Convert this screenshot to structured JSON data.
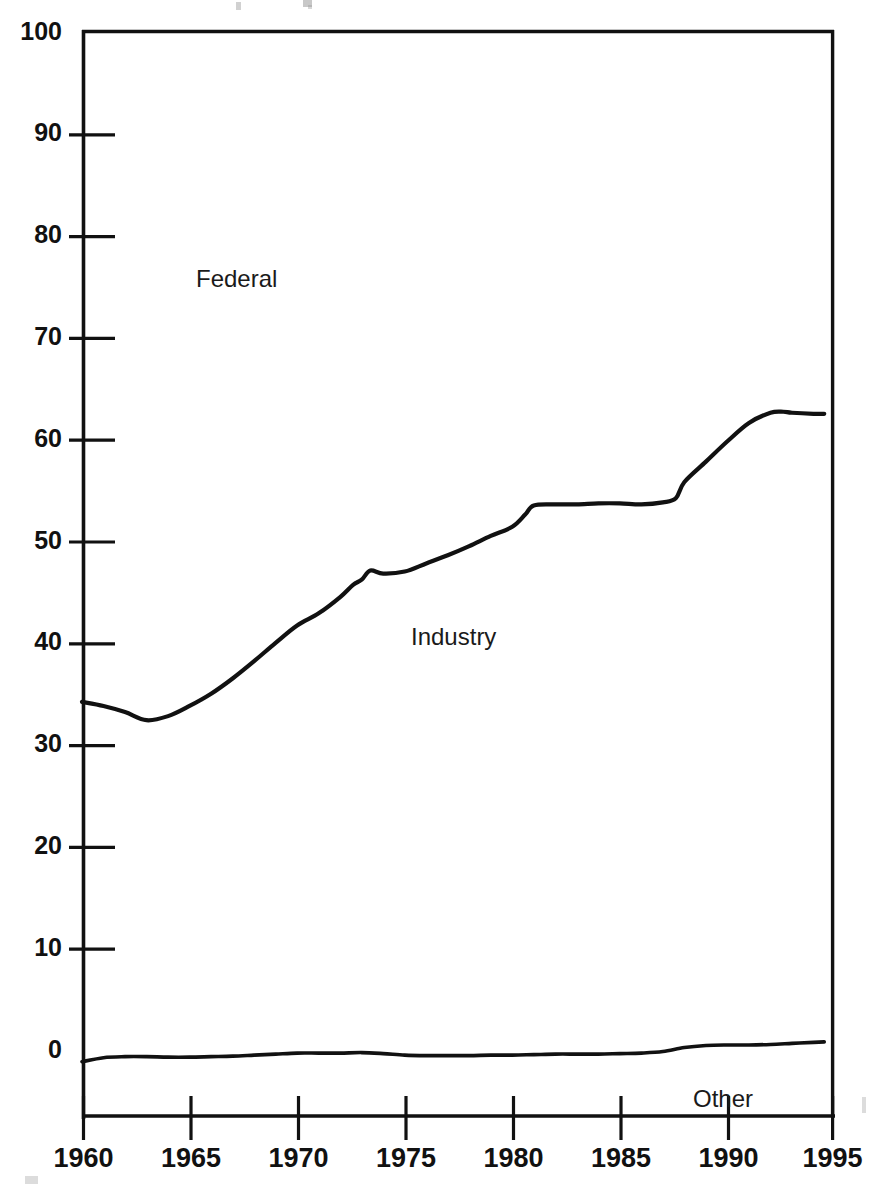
{
  "chart_data": {
    "type": "line",
    "title": "",
    "subtitle": "",
    "xlabel": "",
    "ylabel": "",
    "xlim": [
      1960,
      1995
    ],
    "ylim": [
      0,
      100
    ],
    "xticks": [
      1960,
      1965,
      1970,
      1975,
      1980,
      1985,
      1990,
      1995
    ],
    "xtick_labels": [
      "1960",
      "1965",
      "1970",
      "1975",
      "1980",
      "1985",
      "1990",
      "1995"
    ],
    "yticks": [
      0,
      10,
      20,
      30,
      40,
      50,
      60,
      70,
      80,
      90,
      100
    ],
    "ytick_labels": [
      "0",
      "10",
      "20",
      "30",
      "40",
      "50",
      "60",
      "70",
      "80",
      "90",
      "100"
    ],
    "grid": false,
    "legend_position": "inline-annotations",
    "line_color": "#111111",
    "background_color": "#ffffff",
    "annotations": [
      {
        "text": "Federal",
        "x": 1964.2,
        "y": 78.0
      },
      {
        "text": "Industry",
        "x": 1975.4,
        "y": 43.0
      },
      {
        "text": "Other",
        "x": 1988.6,
        "y": -5.2
      }
    ],
    "series": [
      {
        "name": "Industry",
        "label": "Industry",
        "x": [
          1960,
          1961,
          1962,
          1963,
          1964,
          1965,
          1966,
          1967,
          1968,
          1969,
          1970,
          1971,
          1972,
          1972.6,
          1973,
          1973.4,
          1974,
          1975,
          1976,
          1977,
          1978,
          1979,
          1980,
          1980.6,
          1981,
          1982,
          1983,
          1984,
          1985,
          1986,
          1987,
          1987.6,
          1988,
          1989,
          1990,
          1991,
          1992,
          1992.6,
          1993,
          1994,
          1994.5
        ],
        "values": [
          34.0,
          33.6,
          33.0,
          32.2,
          32.6,
          33.6,
          34.8,
          36.3,
          38.0,
          39.8,
          41.5,
          42.7,
          44.3,
          45.5,
          46.0,
          46.9,
          46.6,
          46.8,
          47.6,
          48.4,
          49.3,
          50.3,
          51.2,
          52.4,
          53.3,
          53.4,
          53.4,
          53.5,
          53.5,
          53.4,
          53.6,
          54.0,
          55.6,
          57.6,
          59.6,
          61.4,
          62.4,
          62.5,
          62.4,
          62.3,
          62.3
        ]
      },
      {
        "name": "Other",
        "label": "Other",
        "x": [
          1960,
          1961,
          1962,
          1963,
          1964,
          1965,
          1966,
          1967,
          1968,
          1969,
          1970,
          1971,
          1972,
          1973,
          1974,
          1975,
          1976,
          1977,
          1978,
          1979,
          1980,
          1981,
          1982,
          1983,
          1984,
          1985,
          1986,
          1987,
          1988,
          1989,
          1990,
          1991,
          1992,
          1993,
          1994,
          1994.5
        ],
        "values": [
          -1.35,
          -0.95,
          -0.85,
          -0.85,
          -0.9,
          -0.9,
          -0.85,
          -0.8,
          -0.7,
          -0.6,
          -0.5,
          -0.5,
          -0.5,
          -0.45,
          -0.55,
          -0.7,
          -0.75,
          -0.75,
          -0.75,
          -0.7,
          -0.7,
          -0.65,
          -0.6,
          -0.6,
          -0.6,
          -0.55,
          -0.5,
          -0.35,
          0.05,
          0.25,
          0.3,
          0.3,
          0.35,
          0.45,
          0.55,
          0.6
        ]
      }
    ]
  },
  "chart_meta": {
    "plot_left_px": 82,
    "plot_right_px": 835,
    "plot_top_px": 30,
    "plot_zero_px": 1048,
    "axis_baseline_px": 1117
  }
}
